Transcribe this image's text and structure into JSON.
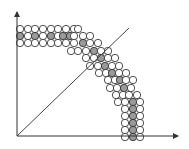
{
  "diagram": {
    "title": "",
    "axes": {
      "origin": [
        17,
        136
      ],
      "x_end": [
        178,
        136
      ],
      "y_end": [
        17,
        12
      ],
      "color": "#333333"
    },
    "diagonal_line": {
      "from": [
        17,
        136
      ],
      "to": [
        129,
        28
      ],
      "color": "#444444"
    },
    "circle_radius": 3.7,
    "colors": {
      "white_fill": "#ffffff",
      "gray_fill": "#9a9a9a",
      "stroke": "#222222"
    },
    "circles": [
      [
        20,
        29,
        0
      ],
      [
        28,
        29,
        0
      ],
      [
        35,
        29,
        0
      ],
      [
        43,
        29,
        0
      ],
      [
        51,
        29,
        0
      ],
      [
        58,
        29,
        0
      ],
      [
        66,
        29,
        0
      ],
      [
        74,
        29,
        0
      ],
      [
        78,
        29,
        0
      ],
      [
        20,
        36,
        1
      ],
      [
        28,
        36,
        0
      ],
      [
        35,
        36,
        1
      ],
      [
        43,
        36,
        0
      ],
      [
        51,
        36,
        1
      ],
      [
        58,
        36,
        0
      ],
      [
        63,
        36,
        1
      ],
      [
        70,
        36,
        1
      ],
      [
        74,
        36,
        0
      ],
      [
        20,
        43,
        0
      ],
      [
        28,
        43,
        0
      ],
      [
        35,
        43,
        0
      ],
      [
        43,
        43,
        0
      ],
      [
        51,
        43,
        0
      ],
      [
        58,
        43,
        0
      ],
      [
        66,
        43,
        0
      ],
      [
        74,
        43,
        0
      ],
      [
        83,
        36,
        0
      ],
      [
        90,
        36,
        0
      ],
      [
        83,
        43,
        1
      ],
      [
        90,
        43,
        0
      ],
      [
        98,
        43,
        0
      ],
      [
        71,
        51,
        0
      ],
      [
        78,
        51,
        0
      ],
      [
        86,
        51,
        0
      ],
      [
        94,
        51,
        1
      ],
      [
        101,
        51,
        0
      ],
      [
        108,
        51,
        0
      ],
      [
        86,
        58,
        0
      ],
      [
        94,
        58,
        0
      ],
      [
        101,
        58,
        1
      ],
      [
        108,
        58,
        0
      ],
      [
        115,
        58,
        0
      ],
      [
        90,
        66,
        0
      ],
      [
        98,
        66,
        0
      ],
      [
        105,
        66,
        1
      ],
      [
        112,
        66,
        0
      ],
      [
        119,
        66,
        0
      ],
      [
        99,
        73,
        0
      ],
      [
        106,
        73,
        0
      ],
      [
        112,
        73,
        1
      ],
      [
        119,
        73,
        0
      ],
      [
        126,
        73,
        0
      ],
      [
        108,
        80,
        0
      ],
      [
        115,
        80,
        0
      ],
      [
        120,
        80,
        1
      ],
      [
        126,
        80,
        0
      ],
      [
        133,
        80,
        0
      ],
      [
        110,
        88,
        0
      ],
      [
        117,
        88,
        0
      ],
      [
        124,
        88,
        1
      ],
      [
        131,
        88,
        0
      ],
      [
        116,
        95,
        0
      ],
      [
        123,
        95,
        0
      ],
      [
        129,
        95,
        0
      ],
      [
        137,
        95,
        0
      ],
      [
        118,
        102,
        0
      ],
      [
        125,
        102,
        0
      ],
      [
        133,
        102,
        1
      ],
      [
        140,
        102,
        0
      ],
      [
        125,
        109,
        0
      ],
      [
        133,
        109,
        1
      ],
      [
        140,
        109,
        0
      ],
      [
        125,
        116,
        0
      ],
      [
        133,
        116,
        1
      ],
      [
        140,
        116,
        0
      ],
      [
        125,
        123,
        0
      ],
      [
        133,
        123,
        1
      ],
      [
        140,
        123,
        0
      ],
      [
        125,
        130,
        0
      ],
      [
        133,
        130,
        1
      ],
      [
        140,
        130,
        0
      ],
      [
        125,
        137,
        0
      ],
      [
        133,
        137,
        1
      ],
      [
        140,
        137,
        0
      ]
    ]
  }
}
